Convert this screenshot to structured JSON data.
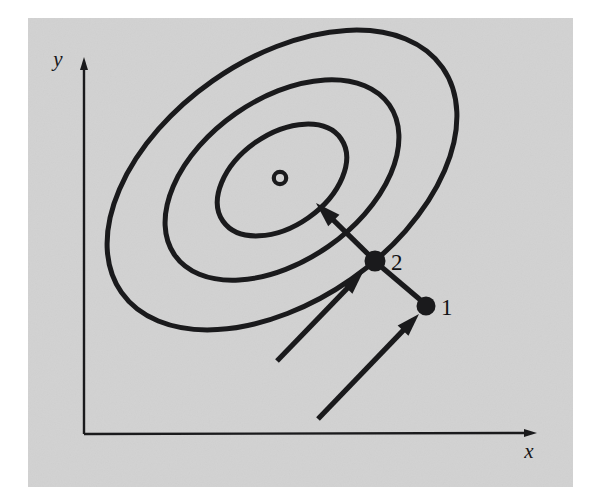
{
  "figure": {
    "panel": {
      "background_color": "#d2d2d2",
      "border_color": "#ffffff",
      "x": 28,
      "y": 18,
      "width": 545,
      "height": 469
    },
    "ink_color": "#1a1a1c",
    "axes": {
      "origin_x": 84,
      "origin_y": 434,
      "x_axis_label": "x",
      "x_axis_label_x": 529,
      "x_axis_label_y": 458,
      "x_axis_tip_x": 537,
      "x_axis_tip_y": 433,
      "y_axis_label": "y",
      "y_axis_label_x": 58,
      "y_axis_label_y": 66,
      "y_axis_tip_x": 84,
      "y_axis_tip_y": 57,
      "line_width": 2.4
    },
    "contours": {
      "center_x": 282,
      "center_y": 180,
      "rotation_deg": -35,
      "line_width": 5,
      "levels": [
        {
          "name": "outer-contour",
          "rx": 196,
          "ry": 121
        },
        {
          "name": "middle-contour",
          "rx": 131,
          "ry": 81
        },
        {
          "name": "inner-contour",
          "rx": 72,
          "ry": 46
        }
      ]
    },
    "minimum_marker": {
      "name": "minimum-marker",
      "cx": 280,
      "cy": 178,
      "r": 6.2,
      "stroke_width": 4.2
    },
    "points": [
      {
        "id": "1",
        "label": "1",
        "cx": 426,
        "cy": 306,
        "r": 9.5,
        "label_x": 441,
        "label_y": 315
      },
      {
        "id": "2",
        "label": "2",
        "cx": 375,
        "cy": 261,
        "r": 10.5,
        "label_x": 391,
        "label_y": 270
      }
    ],
    "arrows": [
      {
        "name": "arrow-into-point-1",
        "x1": 318,
        "y1": 419,
        "x2": 419,
        "y2": 314,
        "line_width": 5.2,
        "head_length": 23,
        "head_width": 15
      },
      {
        "name": "arrow-into-point-2",
        "x1": 277,
        "y1": 361,
        "x2": 363,
        "y2": 272,
        "line_width": 5.2,
        "head_length": 23,
        "head_width": 15
      },
      {
        "name": "arrow-point-2-to-minimum",
        "x1": 372,
        "y1": 258,
        "x2": 316,
        "y2": 203,
        "line_width": 5.2,
        "head_length": 25,
        "head_width": 16
      },
      {
        "name": "segment-point-1-to-point-2",
        "x1": 424,
        "y1": 303,
        "x2": 378,
        "y2": 264,
        "line_width": 5.2,
        "head_length": 0,
        "head_width": 0
      }
    ]
  }
}
